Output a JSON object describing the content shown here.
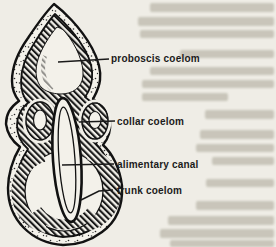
{
  "figure": {
    "kind": "scanned textbook anatomical line diagram",
    "paper_color": "#efede6",
    "ink_color": "#1b1b1b",
    "labels": [
      {
        "text": "proboscis coelom"
      },
      {
        "text": "collar coelom"
      },
      {
        "text": "alimentary canal"
      },
      {
        "text": "trunk coelom"
      }
    ]
  }
}
